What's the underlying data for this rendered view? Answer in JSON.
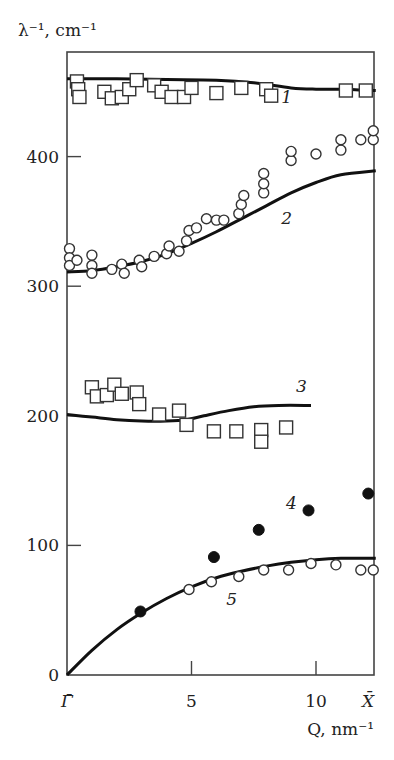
{
  "chart_data": {
    "type": "scatter",
    "title": "",
    "ylabel": "λ⁻¹, cm⁻¹",
    "xlabel": "Q, nm⁻¹",
    "xlim": [
      0,
      12.4
    ],
    "ylim": [
      0,
      480
    ],
    "x_ticks": [
      {
        "value": 0,
        "label": "Γ̄"
      },
      {
        "value": 5,
        "label": "5"
      },
      {
        "value": 10,
        "label": "10"
      },
      {
        "value": 12.4,
        "label": "X̄"
      }
    ],
    "y_ticks": [
      {
        "value": 0,
        "label": "0"
      },
      {
        "value": 100,
        "label": "100"
      },
      {
        "value": 200,
        "label": "200"
      },
      {
        "value": 300,
        "label": "300"
      },
      {
        "value": 400,
        "label": "400"
      }
    ],
    "grid": false,
    "curves": [
      {
        "name": "1",
        "label_pos": [
          8.6,
          441
        ],
        "points": [
          [
            0,
            460
          ],
          [
            2,
            460
          ],
          [
            4,
            459.5
          ],
          [
            6,
            459
          ],
          [
            7.5,
            457
          ],
          [
            9,
            453
          ],
          [
            10,
            452
          ],
          [
            11,
            452
          ],
          [
            12.4,
            451
          ]
        ]
      },
      {
        "name": "2",
        "label_pos": [
          8.6,
          350
        ],
        "points": [
          [
            0,
            311
          ],
          [
            1,
            312
          ],
          [
            2,
            315
          ],
          [
            3,
            319
          ],
          [
            4,
            325
          ],
          [
            5,
            333
          ],
          [
            6,
            342
          ],
          [
            7,
            352
          ],
          [
            8,
            362
          ],
          [
            9,
            372
          ],
          [
            10,
            380
          ],
          [
            11,
            386
          ],
          [
            12.4,
            389
          ]
        ]
      },
      {
        "name": "3",
        "label_pos": [
          9.2,
          218
        ],
        "points": [
          [
            0,
            201
          ],
          [
            1,
            199
          ],
          [
            2,
            197
          ],
          [
            3,
            196
          ],
          [
            4,
            196
          ],
          [
            4.8,
            197
          ],
          [
            5.5,
            200
          ],
          [
            6.5,
            204
          ],
          [
            7.5,
            207
          ],
          [
            8.5,
            208
          ],
          [
            9.8,
            208
          ]
        ]
      },
      {
        "name": "5",
        "label_pos": [
          6.4,
          55
        ],
        "points": [
          [
            0,
            0
          ],
          [
            1,
            19
          ],
          [
            2,
            35
          ],
          [
            3,
            48
          ],
          [
            4,
            59
          ],
          [
            5,
            68
          ],
          [
            6,
            75
          ],
          [
            7,
            80
          ],
          [
            8,
            84
          ],
          [
            9,
            87
          ],
          [
            10,
            89
          ],
          [
            11,
            90
          ],
          [
            12.4,
            90
          ]
        ]
      }
    ],
    "series": [
      {
        "name": "1",
        "marker": "square-open",
        "points": [
          [
            0.4,
            458
          ],
          [
            0.45,
            452
          ],
          [
            0.5,
            446
          ],
          [
            1.5,
            450
          ],
          [
            1.8,
            445
          ],
          [
            2.2,
            446
          ],
          [
            2.5,
            452
          ],
          [
            2.8,
            459
          ],
          [
            3.5,
            455
          ],
          [
            3.8,
            450
          ],
          [
            4.2,
            446
          ],
          [
            4.7,
            446
          ],
          [
            5.0,
            453
          ],
          [
            6.0,
            449
          ],
          [
            7.0,
            453
          ],
          [
            8.0,
            452
          ],
          [
            8.2,
            447
          ],
          [
            11.2,
            451
          ],
          [
            12.0,
            451
          ]
        ]
      },
      {
        "name": "2",
        "marker": "circle-open",
        "points": [
          [
            0.1,
            329
          ],
          [
            0.1,
            322
          ],
          [
            0.1,
            316
          ],
          [
            0.4,
            320
          ],
          [
            1.0,
            324
          ],
          [
            1.0,
            316
          ],
          [
            1.0,
            310
          ],
          [
            1.8,
            313
          ],
          [
            2.2,
            317
          ],
          [
            2.3,
            310
          ],
          [
            2.9,
            320
          ],
          [
            3.0,
            315
          ],
          [
            3.5,
            323
          ],
          [
            4.0,
            325
          ],
          [
            4.1,
            331
          ],
          [
            4.5,
            327
          ],
          [
            4.8,
            335
          ],
          [
            4.9,
            343
          ],
          [
            5.2,
            345
          ],
          [
            5.6,
            352
          ],
          [
            6.0,
            351
          ],
          [
            6.3,
            351
          ],
          [
            6.9,
            356
          ],
          [
            7.0,
            363
          ],
          [
            7.1,
            370
          ],
          [
            7.9,
            372
          ],
          [
            7.9,
            379
          ],
          [
            7.9,
            387
          ],
          [
            9.0,
            397
          ],
          [
            9.0,
            404
          ],
          [
            10.0,
            402
          ],
          [
            11.0,
            405
          ],
          [
            11.0,
            413
          ],
          [
            11.8,
            413
          ],
          [
            12.3,
            413
          ],
          [
            12.3,
            420
          ]
        ]
      },
      {
        "name": "3",
        "marker": "square-open",
        "points": [
          [
            1.0,
            222
          ],
          [
            1.2,
            215
          ],
          [
            1.6,
            216
          ],
          [
            1.9,
            224
          ],
          [
            2.2,
            217
          ],
          [
            2.8,
            218
          ],
          [
            2.9,
            209
          ],
          [
            3.7,
            201
          ],
          [
            4.5,
            204
          ],
          [
            4.8,
            193
          ],
          [
            5.9,
            188
          ],
          [
            6.8,
            188
          ],
          [
            7.8,
            189
          ],
          [
            7.8,
            180
          ],
          [
            8.8,
            191
          ]
        ]
      },
      {
        "name": "4",
        "marker": "circle-filled",
        "points": [
          [
            2.95,
            49
          ],
          [
            5.9,
            91
          ],
          [
            7.7,
            112
          ],
          [
            9.7,
            127
          ],
          [
            12.1,
            140
          ]
        ]
      },
      {
        "name": "5",
        "marker": "circle-open",
        "points": [
          [
            4.9,
            66
          ],
          [
            5.8,
            72
          ],
          [
            6.9,
            76
          ],
          [
            7.9,
            81
          ],
          [
            8.9,
            81
          ],
          [
            9.8,
            86
          ],
          [
            10.8,
            85
          ],
          [
            11.8,
            81
          ],
          [
            12.3,
            81
          ]
        ]
      }
    ]
  }
}
